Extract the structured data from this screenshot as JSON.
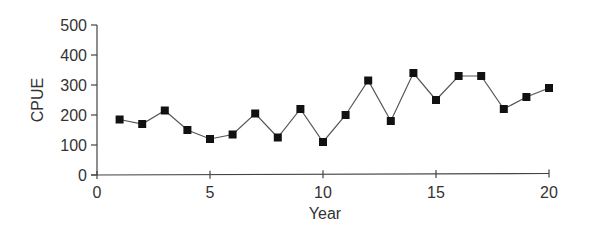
{
  "chart_data": {
    "type": "line",
    "title": "",
    "xlabel": "Year",
    "ylabel": "CPUE",
    "xlim": [
      0,
      20
    ],
    "ylim": [
      0,
      500
    ],
    "x_ticks": [
      0,
      5,
      10,
      15,
      20
    ],
    "y_ticks": [
      0,
      100,
      200,
      300,
      400,
      500
    ],
    "grid": false,
    "legend": null,
    "marker": "square",
    "series": [
      {
        "name": "CPUE",
        "x": [
          1,
          2,
          3,
          4,
          5,
          6,
          7,
          8,
          9,
          10,
          11,
          12,
          13,
          14,
          15,
          16,
          17,
          18,
          19,
          20
        ],
        "values": [
          185,
          170,
          215,
          150,
          120,
          135,
          205,
          125,
          220,
          110,
          200,
          315,
          180,
          340,
          250,
          330,
          330,
          220,
          260,
          290
        ]
      }
    ]
  },
  "colors": {
    "line": "#555555",
    "marker": "#111111",
    "axis": "#444444",
    "text": "#333333"
  }
}
